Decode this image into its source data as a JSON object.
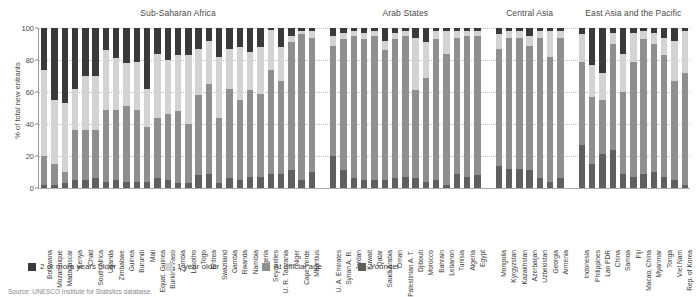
{
  "axis": {
    "ylabel": "% of total new entrants",
    "yticks": [
      "0",
      "20",
      "40",
      "60",
      "80",
      "100"
    ]
  },
  "legend": {
    "items": [
      {
        "label": "2 or more years older",
        "color": "#3a3a3a",
        "swatch_name": "legend-swatch-two-or-more-years-older"
      },
      {
        "label": "1 year older",
        "color": "#d3d3d3",
        "swatch_name": "legend-swatch-one-year-older"
      },
      {
        "label": "At official age",
        "color": "#8f8f8f",
        "swatch_name": "legend-swatch-at-official-age"
      },
      {
        "label": "Younger",
        "color": "#5f5f5f",
        "swatch_name": "legend-swatch-younger"
      }
    ]
  },
  "source": {
    "text": "Source: UNESCO Institute for Statistics database."
  },
  "groups": [
    {
      "title": "Sub-Saharan Africa"
    },
    {
      "title": "Arab States"
    },
    {
      "title": "Central Asia"
    },
    {
      "title": "East Asia and the Pacific"
    }
  ],
  "chart_data": {
    "type": "bar",
    "subtype": "stacked-bar-100-percent",
    "title": "",
    "xlabel": "",
    "ylabel": "% of total new entrants",
    "ylim": [
      0,
      100
    ],
    "grid": true,
    "legend_position": "bottom-left",
    "series": [
      {
        "name": "2 or more years older",
        "color": "#3a3a3a"
      },
      {
        "name": "1 year older",
        "color": "#d3d3d3"
      },
      {
        "name": "At official age",
        "color": "#8f8f8f"
      },
      {
        "name": "Younger",
        "color": "#5f5f5f"
      }
    ],
    "groups": [
      {
        "name": "Sub-Saharan Africa",
        "categories": [
          "Botswana",
          "Mozambique",
          "Madagascar",
          "Kenya",
          "Chad",
          "South Africa",
          "Uganda",
          "Zimbabwe",
          "Guinea",
          "Burundi",
          "Mali",
          "Equat. Guinea",
          "Burkina Faso",
          "Zambia",
          "Lesotho",
          "Togo",
          "Eritrea",
          "Swaziland",
          "Gambia",
          "Rwanda",
          "Namibia",
          "Nigeria",
          "Seychelles",
          "U. R. Tanzania",
          "Niger",
          "Cape Verde",
          "Mauritius"
        ],
        "values": {
          "2 or more years older": [
            26,
            45,
            47,
            38,
            30,
            30,
            14,
            19,
            22,
            21,
            38,
            16,
            20,
            17,
            17,
            13,
            8,
            18,
            13,
            12,
            15,
            12,
            1,
            12,
            5,
            2,
            2
          ],
          "1 year older": [
            54,
            40,
            43,
            26,
            34,
            34,
            37,
            32,
            27,
            30,
            24,
            40,
            34,
            35,
            43,
            29,
            27,
            38,
            25,
            33,
            24,
            29,
            25,
            21,
            4,
            2,
            4
          ],
          "At official age": [
            18,
            13,
            7,
            31,
            31,
            30,
            45,
            44,
            47,
            45,
            34,
            38,
            41,
            45,
            37,
            50,
            56,
            41,
            56,
            50,
            54,
            52,
            65,
            58,
            80,
            91,
            84
          ],
          "Younger": [
            2,
            2,
            3,
            5,
            5,
            6,
            4,
            5,
            4,
            4,
            4,
            6,
            5,
            3,
            3,
            8,
            9,
            3,
            6,
            5,
            7,
            7,
            9,
            9,
            11,
            5,
            10
          ]
        }
      },
      {
        "name": "Arab States",
        "categories": [
          "U. A. Emirates",
          "Syrian A. R.",
          "Jordan",
          "Kuwait",
          "Qatar",
          "Saudi Arabia",
          "Oman",
          "Palestinian A. T.",
          "Djibouti",
          "Morocco",
          "Bahrain",
          "Lebanon",
          "Tunisia",
          "Algeria",
          "Egypt"
        ],
        "values": {
          "2 or more years older": [
            5,
            3,
            2,
            3,
            2,
            8,
            3,
            2,
            6,
            9,
            2,
            2,
            2,
            2,
            2
          ],
          "1 year older": [
            6,
            4,
            3,
            4,
            3,
            6,
            4,
            3,
            33,
            22,
            5,
            14,
            4,
            3,
            3
          ],
          "At official age": [
            69,
            82,
            89,
            88,
            90,
            81,
            87,
            88,
            55,
            65,
            88,
            82,
            85,
            88,
            87
          ],
          "Younger": [
            20,
            11,
            6,
            5,
            5,
            5,
            6,
            7,
            6,
            4,
            5,
            2,
            9,
            7,
            8
          ]
        }
      },
      {
        "name": "Central Asia",
        "categories": [
          "Mongolia",
          "Kyrgyzstan",
          "Kazakhstan",
          "Azerbaijan",
          "Uzbekistan",
          "Georgia",
          "Armenia"
        ],
        "values": {
          "2 or more years older": [
            4,
            2,
            2,
            5,
            2,
            2,
            2
          ],
          "1 year older": [
            9,
            4,
            4,
            6,
            4,
            16,
            4
          ],
          "At official age": [
            73,
            82,
            82,
            78,
            88,
            78,
            88
          ],
          "Younger": [
            14,
            12,
            12,
            11,
            6,
            4,
            6
          ]
        }
      },
      {
        "name": "East Asia and the Pacific",
        "categories": [
          "Indonesia",
          "Philippines",
          "Lao PDR",
          "China",
          "Samoa",
          "Fiji",
          "Macao, China",
          "Myanmar",
          "Tonga",
          "Viet Nam",
          "Rep. of Korea"
        ],
        "values": {
          "2 or more years older": [
            4,
            23,
            28,
            3,
            16,
            3,
            2,
            3,
            6,
            8,
            2
          ],
          "1 year older": [
            17,
            20,
            17,
            7,
            24,
            18,
            5,
            7,
            11,
            25,
            26
          ],
          "At official age": [
            52,
            42,
            34,
            66,
            51,
            72,
            84,
            80,
            76,
            62,
            70
          ],
          "Younger": [
            27,
            15,
            21,
            24,
            9,
            7,
            9,
            10,
            7,
            5,
            2
          ]
        }
      }
    ]
  }
}
